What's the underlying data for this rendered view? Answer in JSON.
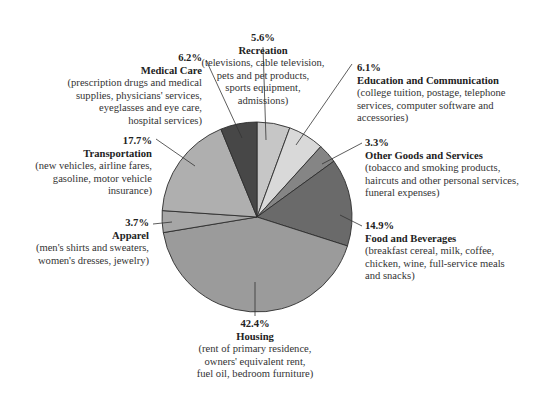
{
  "chart_data": {
    "type": "pie",
    "title": "",
    "center": [
      257,
      217
    ],
    "radius": 95,
    "start_angle_deg": 0,
    "direction": "clockwise",
    "slices": [
      {
        "key": "recreation",
        "label": "Recreation",
        "value": 5.6,
        "percent_label": "5.6%",
        "color": "#c6c6c6",
        "description": "(televisions, cable television, pets and pet products, sports equipment, admissions)"
      },
      {
        "key": "education",
        "label": "Education and Communication",
        "value": 6.1,
        "percent_label": "6.1%",
        "color": "#d9d9d9",
        "description": "(college tuition, postage, telephone services, computer software and accessories)"
      },
      {
        "key": "other",
        "label": "Other Goods and Services",
        "value": 3.3,
        "percent_label": "3.3%",
        "color": "#858585",
        "description": "(tobacco and smoking products, haircuts and other personal services, funeral expenses)"
      },
      {
        "key": "food",
        "label": "Food and Beverages",
        "value": 14.9,
        "percent_label": "14.9%",
        "color": "#6a6a6a",
        "description": "(breakfast cereal, milk, coffee, chicken, wine, full-service meals and snacks)"
      },
      {
        "key": "housing",
        "label": "Housing",
        "value": 42.4,
        "percent_label": "42.4%",
        "color": "#9b9b9b",
        "description": "(rent of primary residence, owners' equivalent rent, fuel oil, bedroom furniture)"
      },
      {
        "key": "apparel",
        "label": "Apparel",
        "value": 3.7,
        "percent_label": "3.7%",
        "color": "#a6a6a6",
        "description": "(men's shirts and sweaters, women's dresses, jewelry)"
      },
      {
        "key": "transportation",
        "label": "Transportation",
        "value": 17.7,
        "percent_label": "17.7%",
        "color": "#afafaf",
        "description": "(new vehicles, airline fares, gasoline, motor vehicle insurance)"
      },
      {
        "key": "medical",
        "label": "Medical Care",
        "value": 6.2,
        "percent_label": "6.2%",
        "color": "#474747",
        "description": "(prescription drugs and medical supplies, physicians' services, eyeglasses and eye care, hospital services)"
      }
    ],
    "legend": "none (callout labels with leader lines)"
  },
  "labels": {
    "recreation": {
      "pct": "5.6%",
      "name": "Recreation",
      "lines": [
        "(televisions, cable television,",
        "pets and pet products,",
        "sports equipment,",
        "admissions)"
      ]
    },
    "medical": {
      "pct": "6.2%",
      "name": "Medical Care",
      "lines": [
        "(prescription drugs and medical",
        "supplies, physicians' services,",
        "eyeglasses and eye care,",
        "hospital services)"
      ]
    },
    "education": {
      "pct": "6.1%",
      "name": "Education and Communication",
      "lines": [
        "(college tuition, postage, telephone",
        "services, computer software and",
        "accessories)"
      ]
    },
    "other": {
      "pct": "3.3%",
      "name": "Other Goods and Services",
      "lines": [
        "(tobacco and smoking products,",
        "haircuts and other personal services,",
        "funeral expenses)"
      ]
    },
    "transportation": {
      "pct": "17.7%",
      "name": "Transportation",
      "lines": [
        "(new vehicles, airline fares,",
        "gasoline, motor vehicle",
        "insurance)"
      ]
    },
    "apparel": {
      "pct": "3.7%",
      "name": "Apparel",
      "lines": [
        "(men's shirts and sweaters,",
        "women's dresses, jewelry)"
      ]
    },
    "food": {
      "pct": "14.9%",
      "name": "Food and Beverages",
      "lines": [
        "(breakfast cereal, milk, coffee,",
        "chicken, wine, full-service meals",
        "and snacks)"
      ]
    },
    "housing": {
      "pct": "42.4%",
      "name": "Housing",
      "lines": [
        "(rent of primary residence,",
        "owners' equivalent rent,",
        "fuel oil, bedroom furniture)"
      ]
    }
  }
}
